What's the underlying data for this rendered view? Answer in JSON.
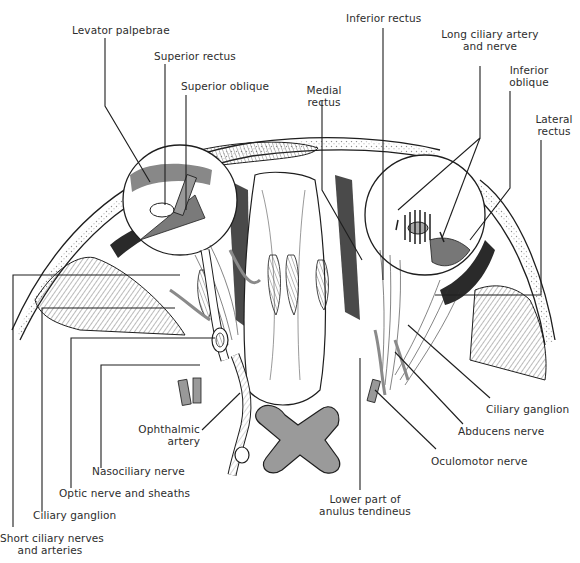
{
  "figure": {
    "colors": {
      "ink": "#1e1e1e",
      "tint": "#9a9a9a",
      "dark_fat": "#2a2a2a",
      "background": "#ffffff"
    }
  },
  "labels": {
    "levator_palpebrae": "Levator palpebrae",
    "superior_rectus": "Superior rectus",
    "superior_oblique": "Superior oblique",
    "inferior_rectus": "Inferior rectus",
    "medial_rectus_1": "Medial",
    "medial_rectus_2": "rectus",
    "long_ciliary_1": "Long ciliary artery",
    "long_ciliary_2": "and nerve",
    "inferior_oblique_1": "Inferior",
    "inferior_oblique_2": "oblique",
    "lateral_rectus_1": "Lateral",
    "lateral_rectus_2": "rectus",
    "ciliary_ganglion_right": "Ciliary ganglion",
    "abducens_nerve": "Abducens nerve",
    "oculomotor_nerve": "Oculomotor nerve",
    "lower_anulus_1": "Lower part of",
    "lower_anulus_2": "anulus tendineus",
    "ophthalmic_artery_1": "Ophthalmic",
    "ophthalmic_artery_2": "artery",
    "nasociliary_nerve": "Nasociliary nerve",
    "optic_nerve": "Optic nerve and sheaths",
    "ciliary_ganglion_left": "Ciliary ganglion",
    "short_ciliary_1": "Short ciliary nerves",
    "short_ciliary_2": "and arteries"
  }
}
